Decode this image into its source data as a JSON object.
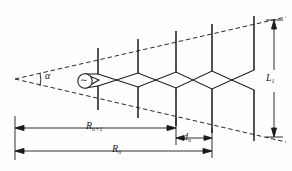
{
  "figure": {
    "labels": {
      "apex_angle": "α",
      "longest_element": "L",
      "longest_element_sub": "1",
      "spacing": "d",
      "spacing_sub": "n",
      "radius_n": "R",
      "radius_n_sub": "n",
      "radius_n_plus_1": "R",
      "radius_n_plus_1_sub": "n+1",
      "source_symbol": "∼"
    },
    "colors": {
      "ink": "#1a1a1a",
      "background": "#fefefe",
      "dashed": "#2a2a2a"
    },
    "geometry": {
      "apex": [
        15,
        79
      ],
      "upper_envelope_end": [
        284,
        18
      ],
      "lower_envelope_end": [
        284,
        140
      ],
      "elements": [
        {
          "x": 98,
          "top": 48,
          "bottom": 110
        },
        {
          "x": 138,
          "top": 39,
          "bottom": 118
        },
        {
          "x": 176,
          "top": 31,
          "bottom": 126
        },
        {
          "x": 212,
          "top": 24,
          "bottom": 133
        },
        {
          "x": 254,
          "top": 16,
          "bottom": 141
        }
      ],
      "feed_y_upper": 76,
      "feed_y_lower": 84,
      "source_circle": {
        "cx": 85,
        "cy": 81,
        "r": 7
      },
      "dim_Rn1": {
        "y": 128,
        "x1": 15,
        "x2": 176
      },
      "dim_dn": {
        "y": 138,
        "x1": 176,
        "x2": 212
      },
      "dim_Rn": {
        "y": 151,
        "x1": 15,
        "x2": 212
      },
      "dim_L1": {
        "x": 274,
        "y1": 20,
        "y2": 137
      }
    }
  }
}
